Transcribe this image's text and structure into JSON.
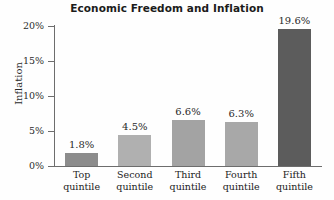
{
  "chart_data": {
    "type": "bar",
    "title": "Economic Freedom and Inflation",
    "xlabel": "",
    "ylabel": "Inflation",
    "categories": [
      "Top quintile",
      "Second quintile",
      "Third quintile",
      "Fourth quintile",
      "Fifth quintile"
    ],
    "category_lines": [
      [
        "Top",
        "quintile"
      ],
      [
        "Second",
        "quintile"
      ],
      [
        "Third",
        "quintile"
      ],
      [
        "Fourth",
        "quintile"
      ],
      [
        "Fifth",
        "quintile"
      ]
    ],
    "values": [
      1.8,
      4.5,
      6.6,
      6.3,
      19.6
    ],
    "value_labels": [
      "1.8%",
      "4.5%",
      "6.6%",
      "6.3%",
      "19.6%"
    ],
    "bar_colors": [
      "#8c8c8c",
      "#b0b0b0",
      "#a3a3a3",
      "#a8a8a8",
      "#5c5c5c"
    ],
    "ylim": [
      0,
      20
    ],
    "yticks": [
      0,
      5,
      10,
      15,
      20
    ],
    "ytick_labels": [
      "0%",
      "5%",
      "10%",
      "15%",
      "20%"
    ],
    "grid": false,
    "legend": "none",
    "axis_color": "#6d6d6d",
    "background": "#fefefe",
    "text_color": "#1b1b1b"
  }
}
